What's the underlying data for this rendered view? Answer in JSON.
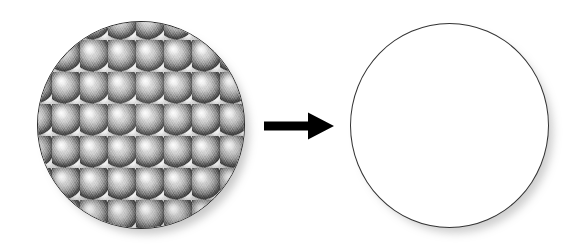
{
  "figure": {
    "type": "process-diagram",
    "width": 585,
    "height": 249,
    "background_color": "#ffffff",
    "description": "A circular sample covered with a hexagonally close-packed monolayer of spheres converts, as indicated by a right-pointing arrow, into a bare white circular sample."
  },
  "left_sample": {
    "name": "coated-substrate",
    "shape": "circle",
    "outline_color": "#2b2b2b",
    "fill_color": "#8d8d8d",
    "surface": "hexagonal close-packed sphere monolayer",
    "sphere_pitch_px": 28,
    "sphere_row_offset_px": 16,
    "highlight_color": "#ffffff",
    "shadow_color": "#3f3f3f",
    "geometry": {
      "left": 37,
      "top": 21,
      "width": 208,
      "height": 208
    }
  },
  "arrow": {
    "name": "transformation-arrow",
    "direction": "right",
    "color": "#000000",
    "geometry": {
      "left": 264,
      "top": 111,
      "width": 72,
      "height": 30
    }
  },
  "right_sample": {
    "name": "bare-substrate",
    "shape": "circle",
    "outline_color": "#333333",
    "fill_color": "#ffffff",
    "surface": "plain / uncoated",
    "geometry": {
      "left": 350,
      "top": 23,
      "width": 199,
      "height": 205
    }
  },
  "chart_data": {
    "type": "diagram",
    "title": "",
    "nodes": [
      {
        "id": "coated",
        "label": "",
        "shape": "circle",
        "fill": "#8d8d8d",
        "texture": "hexagonal close-packed spheres"
      },
      {
        "id": "bare",
        "label": "",
        "shape": "circle",
        "fill": "#ffffff",
        "texture": "none"
      }
    ],
    "edges": [
      {
        "from": "coated",
        "to": "bare",
        "label": "",
        "style": "solid-block-arrow",
        "color": "#000000"
      }
    ]
  }
}
